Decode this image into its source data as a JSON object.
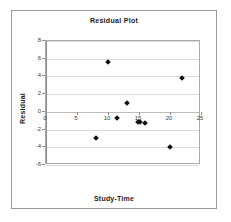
{
  "chart_data": {
    "type": "scatter",
    "title": "Residual Plot",
    "xlabel": "Study-Time",
    "ylabel": "Residual",
    "xlim": [
      0,
      25
    ],
    "ylim": [
      -6,
      8
    ],
    "xticks": [
      0,
      5,
      10,
      15,
      20,
      25
    ],
    "yticks": [
      -6,
      -4,
      -2,
      0,
      2,
      4,
      6,
      8
    ],
    "xtick_labels": [
      "0",
      "5",
      "10",
      "15",
      "20",
      "25"
    ],
    "ytick_labels": [
      "-6",
      "-4",
      "-2",
      "0",
      "2",
      "4",
      "6",
      "8"
    ],
    "grid": "horizontal",
    "legend": "none",
    "marker": "diamond",
    "marker_color": "#121212",
    "series": [
      {
        "name": "Residual",
        "points": [
          {
            "x": 8,
            "y": -3.0
          },
          {
            "x": 10,
            "y": 5.6
          },
          {
            "x": 11.5,
            "y": -0.7
          },
          {
            "x": 13,
            "y": 1.0
          },
          {
            "x": 14.8,
            "y": -1.1
          },
          {
            "x": 15.2,
            "y": -1.1
          },
          {
            "x": 16,
            "y": -1.3
          },
          {
            "x": 20,
            "y": -4.0
          },
          {
            "x": 22,
            "y": 3.8
          }
        ]
      }
    ]
  },
  "colors": {
    "marker": "#121212",
    "gridline": "#d9d9d9",
    "axis": "#8c8c8c",
    "plot_border": "#a9a9a9",
    "frame_border": "#9a9a9a",
    "text": "#1a1a1a"
  }
}
